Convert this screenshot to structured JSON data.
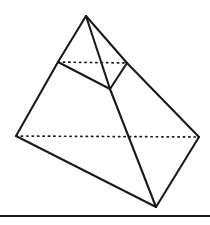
{
  "figure": {
    "background_color": "#ffffff",
    "line_color": "#1a1a1a",
    "canvas": {
      "width": 210,
      "height": 225
    },
    "vertices": {
      "apex": {
        "label": "apex",
        "x": 86,
        "y": 16
      },
      "cut_left": {
        "label": "cut-left",
        "x": 58,
        "y": 62
      },
      "cut_right": {
        "label": "cut-right",
        "x": 127,
        "y": 63
      },
      "cut_front": {
        "label": "cut-front",
        "x": 110,
        "y": 89
      },
      "base_left": {
        "label": "base-left",
        "x": 16,
        "y": 136
      },
      "base_right": {
        "label": "base-right",
        "x": 199,
        "y": 137
      },
      "base_front": {
        "label": "base-front",
        "x": 156,
        "y": 207
      }
    },
    "solid_edges": [
      {
        "name": "apex-to-cut-left",
        "from": "apex",
        "to": "cut_left"
      },
      {
        "name": "apex-to-cut-front",
        "from": "apex",
        "to": "cut_front"
      },
      {
        "name": "apex-to-cut-right",
        "from": "apex",
        "to": "cut_right"
      },
      {
        "name": "cut-left-to-cut-front",
        "from": "cut_left",
        "to": "cut_front"
      },
      {
        "name": "cut-right-to-cut-front",
        "from": "cut_right",
        "to": "cut_front"
      },
      {
        "name": "cut-left-to-base-left",
        "from": "cut_left",
        "to": "base_left"
      },
      {
        "name": "cut-right-to-base-right",
        "from": "cut_right",
        "to": "base_right"
      },
      {
        "name": "cut-front-to-base-front",
        "from": "cut_front",
        "to": "base_front"
      },
      {
        "name": "base-left-to-base-front",
        "from": "base_left",
        "to": "base_front"
      },
      {
        "name": "base-right-to-base-front",
        "from": "base_right",
        "to": "base_front"
      }
    ],
    "hidden_edges": [
      {
        "name": "cut-plane-hidden-edge",
        "from": "cut_left",
        "to": "cut_right",
        "style": "dotted"
      },
      {
        "name": "base-hidden-edge",
        "from": "base_left",
        "to": "base_right",
        "style": "dotted"
      }
    ],
    "baseline": {
      "name": "ground-rule",
      "x1": 0,
      "y1": 216,
      "x2": 210,
      "y2": 216
    }
  }
}
